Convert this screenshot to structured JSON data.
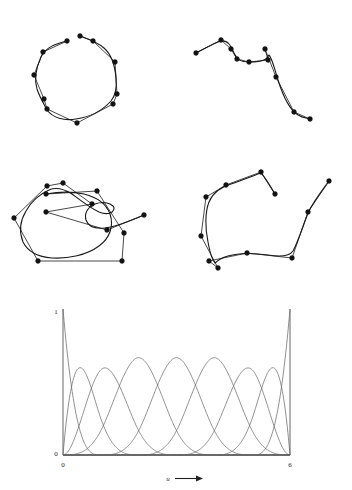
{
  "figure": {
    "background_color": "#ffffff",
    "curve_color": "#1a1a1a",
    "polygon_color": "#1a1a1a",
    "point_color": "#121212",
    "basis_color": "#6a6a6a",
    "axis_color": "#555555",
    "width": 352,
    "height": 490
  },
  "panels": [
    {
      "id": "panel-top-left",
      "name": "closed-loop-bspline",
      "description": "Open B-spline curve forming an almost closed loop with its control polygon",
      "origin": [
        0,
        0
      ],
      "control_points": [
        [
          67,
          41
        ],
        [
          43,
          52
        ],
        [
          34,
          75
        ],
        [
          44,
          99
        ],
        [
          47,
          109
        ],
        [
          77,
          123
        ],
        [
          113,
          104
        ],
        [
          117,
          94
        ],
        [
          115,
          62
        ],
        [
          93,
          41
        ],
        [
          80,
          36
        ]
      ]
    },
    {
      "id": "panel-top-right",
      "name": "s-curve-bspline",
      "description": "Open B-spline curve with an S shape and its control polygon",
      "origin": [
        0,
        0
      ],
      "control_points": [
        [
          196,
          53
        ],
        [
          221,
          40
        ],
        [
          231,
          49
        ],
        [
          237,
          59
        ],
        [
          249,
          62
        ],
        [
          268,
          60
        ],
        [
          265,
          49
        ],
        [
          276,
          77
        ],
        [
          294,
          112
        ],
        [
          310,
          119
        ]
      ]
    },
    {
      "id": "panel-bottom-left",
      "name": "letter-g-bspline",
      "description": "B-spline curve shaped like the letter G with its control polygon",
      "origin": [
        0,
        0
      ],
      "control_points": [
        [
          144,
          215
        ],
        [
          107,
          230
        ],
        [
          46,
          212
        ],
        [
          92,
          204
        ],
        [
          63,
          183
        ],
        [
          47,
          186
        ],
        [
          14,
          218
        ],
        [
          38,
          261
        ],
        [
          122,
          261
        ],
        [
          124,
          233
        ],
        [
          97,
          191
        ],
        [
          46,
          194
        ]
      ]
    },
    {
      "id": "panel-bottom-right",
      "name": "closed-shape-bspline",
      "description": "B-spline curve forming a rounded closed shape with a tail and its control polygon",
      "origin": [
        0,
        0
      ],
      "control_points": [
        [
          329,
          181
        ],
        [
          308,
          212
        ],
        [
          292,
          258
        ],
        [
          247,
          253
        ],
        [
          209,
          261
        ],
        [
          218,
          268
        ],
        [
          201,
          236
        ],
        [
          206,
          197
        ],
        [
          226,
          185
        ],
        [
          261,
          172
        ],
        [
          275,
          194
        ]
      ]
    }
  ],
  "chart_data": {
    "type": "line",
    "title": "",
    "subtitle": "",
    "xlabel": "u",
    "ylabel": "",
    "xlabel_arrow": "⟶",
    "grid": false,
    "legend": false,
    "xlim": [
      0,
      6
    ],
    "ylim": [
      0,
      1
    ],
    "x_tick_labels": [
      "0",
      "6"
    ],
    "x_tick_values": [
      0,
      6
    ],
    "y_tick_labels": [
      "0",
      "1"
    ],
    "y_tick_values": [
      0,
      1
    ],
    "series_count": 10,
    "knot_vector": [
      0,
      0,
      0,
      0,
      1,
      2,
      3,
      4,
      5,
      6,
      6,
      6,
      6
    ],
    "degree": 3,
    "series": [
      {
        "name": "N0",
        "peak_u": 0.0,
        "peak_value": 1.0,
        "support": [
          0,
          1
        ]
      },
      {
        "name": "N1",
        "peak_u": 0.45,
        "peak_value": 0.66,
        "support": [
          0,
          2
        ]
      },
      {
        "name": "N2",
        "peak_u": 1.1,
        "peak_value": 0.66,
        "support": [
          0,
          3
        ]
      },
      {
        "name": "N3",
        "peak_u": 1.9,
        "peak_value": 0.73,
        "support": [
          0,
          4
        ]
      },
      {
        "name": "N4",
        "peak_u": 2.7,
        "peak_value": 0.73,
        "support": [
          1,
          5
        ]
      },
      {
        "name": "N5",
        "peak_u": 3.45,
        "peak_value": 0.73,
        "support": [
          2,
          6
        ]
      },
      {
        "name": "N6",
        "peak_u": 4.2,
        "peak_value": 0.68,
        "support": [
          3,
          6
        ]
      },
      {
        "name": "N7",
        "peak_u": 4.9,
        "peak_value": 0.66,
        "support": [
          4,
          6
        ]
      },
      {
        "name": "N8",
        "peak_u": 5.55,
        "peak_value": 0.66,
        "support": [
          5,
          6
        ]
      },
      {
        "name": "N9",
        "peak_u": 6.0,
        "peak_value": 1.0,
        "support": [
          5,
          6
        ]
      }
    ]
  },
  "axis_labels": {
    "y_top": "1",
    "y_zero": "0",
    "x_zero": "0",
    "x_end": "6",
    "x_axis_name": "u"
  }
}
